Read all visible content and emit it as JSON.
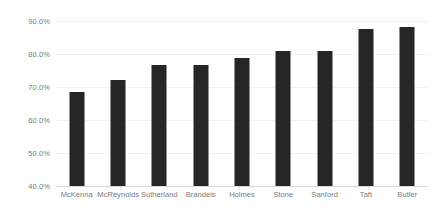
{
  "chart_data": {
    "type": "bar",
    "title": "",
    "subtitle": "",
    "xlabel": "",
    "ylabel": "",
    "categories": [
      "McKenna",
      "McReynolds",
      "Sutherland",
      "Brandeis",
      "Holmes",
      "Stone",
      "Sanford",
      "Taft",
      "Butler"
    ],
    "values": [
      68.6,
      72.2,
      76.8,
      76.8,
      78.8,
      80.8,
      80.9,
      87.7,
      88.3
    ],
    "ylim": [
      40.0,
      90.0
    ],
    "ytick_values": [
      40.0,
      50.0,
      60.0,
      70.0,
      80.0,
      90.0
    ],
    "ytick_labels": [
      "40.0%",
      "50.0%",
      "60.0%",
      "70.0%",
      "80.0%",
      "90.0%"
    ],
    "grid": true,
    "legend": false,
    "legend_position": "none",
    "bar_color": "#262626",
    "gridline_color": "#f2f2f2",
    "axis_color": "#d9d9d9",
    "tick_label_color": "#7b7b7b",
    "background_color": "#ffffff"
  }
}
